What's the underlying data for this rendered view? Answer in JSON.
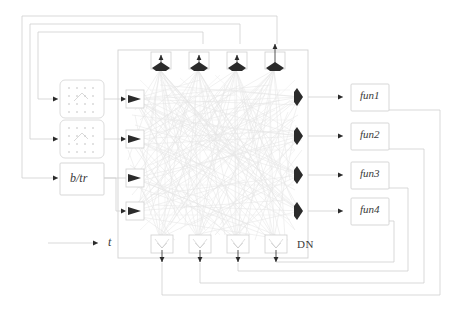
{
  "diagram": {
    "core_block": {
      "label": "DN",
      "name": "developmental-network-block"
    },
    "time_input": {
      "label": "t",
      "name": "time-input"
    },
    "sensor_blocks": [
      {
        "label": "",
        "name": "retina-sensor-block",
        "kind": "stippled-grid"
      },
      {
        "label": "",
        "name": "auditory-sensor-block",
        "kind": "stippled-grid"
      },
      {
        "label": "b/tr",
        "name": "brain-trunk-block",
        "kind": "text"
      }
    ],
    "function_blocks": [
      {
        "label": "fun1",
        "name": "function-block-1"
      },
      {
        "label": "fun2",
        "name": "function-block-2"
      },
      {
        "label": "fun3",
        "name": "function-block-3"
      },
      {
        "label": "fun4",
        "name": "function-block-4"
      }
    ],
    "top_neurons": [
      {
        "name": "top-neuron-1"
      },
      {
        "name": "top-neuron-2"
      },
      {
        "name": "top-neuron-3"
      },
      {
        "name": "top-neuron-4"
      }
    ],
    "bottom_neurons": [
      {
        "name": "bottom-neuron-1"
      },
      {
        "name": "bottom-neuron-2"
      },
      {
        "name": "bottom-neuron-3"
      },
      {
        "name": "bottom-neuron-4"
      }
    ],
    "left_inputs": [
      {
        "name": "left-input-port-1"
      },
      {
        "name": "left-input-port-2"
      },
      {
        "name": "left-input-port-3"
      },
      {
        "name": "left-input-port-4"
      }
    ],
    "right_neurons": [
      {
        "name": "right-neuron-1"
      },
      {
        "name": "right-neuron-2"
      },
      {
        "name": "right-neuron-3"
      },
      {
        "name": "right-neuron-4"
      }
    ],
    "colors": {
      "line": "#cfcfcf",
      "mesh": "#e2e2e2",
      "neuron": "#2b2b2b",
      "box_border": "#d2d2d2",
      "text": "#3a3a3a",
      "background": "#ffffff"
    }
  }
}
